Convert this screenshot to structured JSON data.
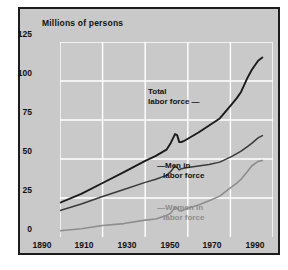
{
  "chart_data": {
    "type": "line",
    "title": "Millions of persons",
    "xlabel": "",
    "ylabel": "Millions of persons",
    "xlim": [
      1890,
      1990
    ],
    "ylim": [
      0,
      125
    ],
    "xticks": [
      "1890",
      "1910",
      "1930",
      "1950",
      "1970",
      "1990"
    ],
    "yticks": [
      "0",
      "25",
      "50",
      "75",
      "100",
      "125"
    ],
    "grid": true,
    "legend_position": "inline-annotations",
    "colors": {
      "total": "#1b1b1b",
      "men": "#3a3a3a",
      "women": "#8d8d8d",
      "panel_background": "#c9c9c9",
      "gridline": "#ffffff",
      "frame": "#1c1c1c"
    },
    "annotations": [
      {
        "name": "total",
        "label_line1": "Total",
        "label_line2": "labor force",
        "leader": "—"
      },
      {
        "name": "men",
        "label_line1": "Men in",
        "label_line2": "labor force",
        "leader": "—"
      },
      {
        "name": "women",
        "label_line1": "Women in",
        "label_line2": "labor force",
        "leader": "—"
      }
    ],
    "x": [
      1890,
      1900,
      1910,
      1920,
      1930,
      1935,
      1940,
      1942,
      1944,
      1945,
      1946,
      1947,
      1948,
      1950,
      1955,
      1960,
      1965,
      1970,
      1973,
      1975,
      1978,
      1980,
      1983,
      1985
    ],
    "series": [
      {
        "name": "Total labor force",
        "values": [
          22.0,
          27.6,
          34.6,
          41.6,
          48.8,
          52.0,
          56.0,
          60.3,
          66.0,
          65.3,
          60.8,
          60.9,
          61.4,
          63.0,
          67.0,
          71.5,
          76.0,
          84.0,
          89.0,
          93.0,
          102.0,
          107.0,
          113.0,
          115.0
        ]
      },
      {
        "name": "Men in labor force",
        "values": [
          17.0,
          21.2,
          26.0,
          30.5,
          35.0,
          37.0,
          39.5,
          42.0,
          45.5,
          44.5,
          43.0,
          43.8,
          44.0,
          44.5,
          45.5,
          46.5,
          48.0,
          51.2,
          53.5,
          55.0,
          58.0,
          60.0,
          63.5,
          65.0
        ]
      },
      {
        "name": "Women in labor force",
        "values": [
          4.0,
          5.3,
          7.4,
          8.6,
          10.8,
          11.5,
          13.8,
          15.3,
          19.0,
          18.6,
          16.8,
          16.7,
          17.3,
          18.4,
          20.5,
          23.2,
          26.2,
          31.5,
          34.5,
          37.0,
          42.0,
          45.5,
          48.5,
          49.0
        ]
      }
    ]
  },
  "ticks": {
    "y": [
      "125",
      "100",
      "75",
      "50",
      "25",
      "0"
    ],
    "x": [
      "1890",
      "1910",
      "1930",
      "1950",
      "1970",
      "1990"
    ]
  },
  "labels": {
    "title": "Millions of persons",
    "total_l1": "Total",
    "total_l2": "labor force —",
    "men_l1": "—Men in",
    "men_l2": "labor force",
    "women_l1": "—Women in",
    "women_l2": "labor force"
  }
}
